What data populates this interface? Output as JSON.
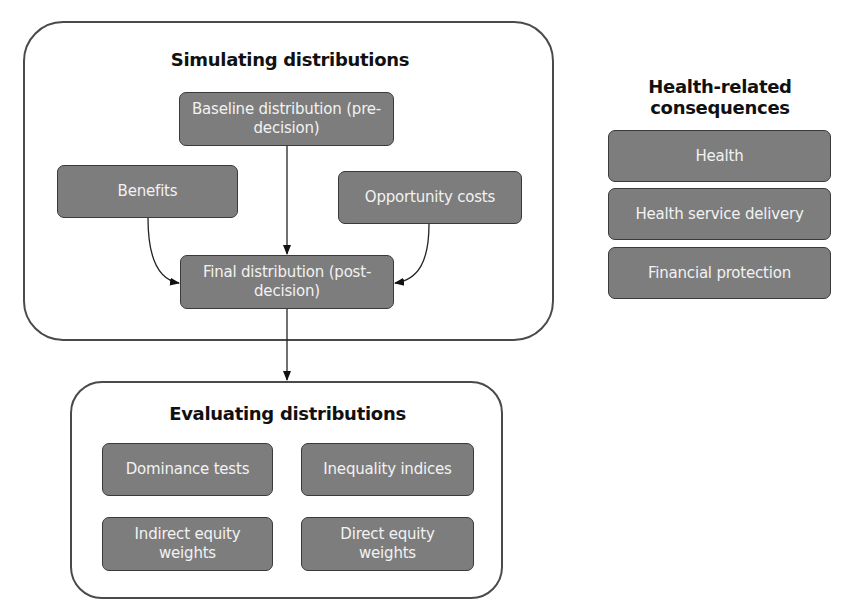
{
  "simulating": {
    "title": "Simulating distributions",
    "baseline": "Baseline distribution (pre-decision)",
    "benefits": "Benefits",
    "opportunity_costs": "Opportunity costs",
    "final": "Final distribution (post-decision)"
  },
  "evaluating": {
    "title": "Evaluating distributions",
    "items": [
      "Dominance tests",
      "Inequality indices",
      "Indirect equity weights",
      "Direct equity weights"
    ]
  },
  "consequences": {
    "title": "Health-related consequences",
    "items": [
      "Health",
      "Health service delivery",
      "Financial protection"
    ]
  },
  "colors": {
    "box_fill": "#7d7d7d",
    "box_text": "#f2f2f2",
    "border": "#3a3a3a"
  }
}
